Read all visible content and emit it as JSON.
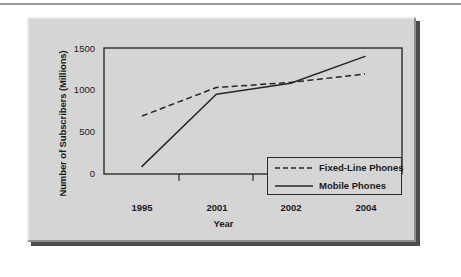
{
  "chart_data": {
    "type": "line",
    "title": "",
    "xlabel": "Year",
    "ylabel": "Number of Subscribers (Millions)",
    "categories": [
      "1995",
      "2001",
      "2002",
      "2004"
    ],
    "yticks": [
      "0",
      "500",
      "1000",
      "1500"
    ],
    "ylim": [
      0,
      1500
    ],
    "grid": false,
    "legend_position": "inside-lower-right",
    "series": [
      {
        "name": "Fixed-Line Phones",
        "style": "dashed",
        "color": "#262626",
        "values": [
          690,
          1030,
          1090,
          1190
        ]
      },
      {
        "name": "Mobile Phones",
        "style": "solid",
        "color": "#262626",
        "values": [
          90,
          950,
          1080,
          1400
        ]
      }
    ]
  },
  "figure": {
    "panel_background": "#d5d5d5",
    "page_background": "#ffffff",
    "axis_color": "#2b2b2b"
  }
}
